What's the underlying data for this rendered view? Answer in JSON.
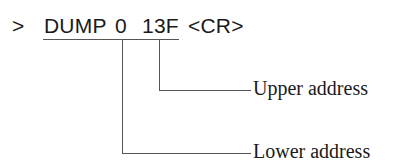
{
  "command": {
    "prompt": ">",
    "keyword": "DUMP",
    "arg1": "0",
    "arg2": "13F",
    "terminator": "<CR>"
  },
  "annotations": [
    {
      "label": "Upper address",
      "points_to": "13F"
    },
    {
      "label": "Lower address",
      "points_to": "0"
    }
  ]
}
